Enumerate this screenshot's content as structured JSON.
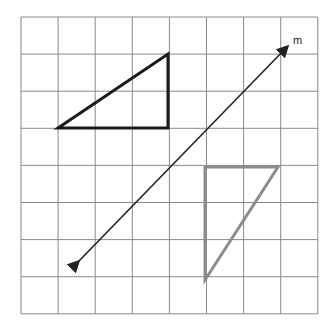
{
  "diagram": {
    "grid": {
      "cols": 8,
      "rows": 8,
      "left": 21,
      "top": 17,
      "cell": 37.1,
      "color": "#8a8a8a"
    },
    "line_m": {
      "label": "m",
      "from": [
        78,
        262
      ],
      "to": [
        287,
        47
      ],
      "color": "#222222"
    },
    "triangles": [
      {
        "name": "original",
        "points": [
          [
            58,
            128
          ],
          [
            168,
            54
          ],
          [
            168,
            128
          ]
        ],
        "color": "#1a1a1a",
        "width": 3
      },
      {
        "name": "image",
        "points": [
          [
            205,
            167
          ],
          [
            278,
            167
          ],
          [
            205,
            280
          ]
        ],
        "color": "#8c8c8c",
        "width": 3
      }
    ]
  }
}
